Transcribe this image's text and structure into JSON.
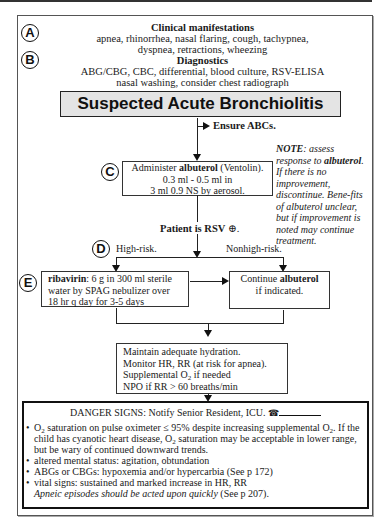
{
  "header": {
    "clinical_manifestations": {
      "label": "A",
      "title": "Clinical manifestations",
      "line1": "apnea, rhinorrhea, nasal flaring, cough, tachypnea,",
      "line2": "dyspnea, retractions, wheezing"
    },
    "diagnostics": {
      "label": "B",
      "title": "Diagnostics",
      "line1": "ABG/CBG, CBC, differential, blood culture, RSV-ELISA",
      "line2": "nasal washing, consider chest radiograph"
    }
  },
  "title": "Suspected Acute Bronchiolitis",
  "ensure_abcs": "Ensure ABCs.",
  "step_c": {
    "label": "C",
    "line1_pre": "Administer ",
    "line1_bold": "albuterol",
    "line1_post": " (Ventolin).",
    "line2": "0.3 ml - 0.5 ml in",
    "line3": "3 ml  0.9 NS by aerosol."
  },
  "note": {
    "bold1": "NOTE",
    "text1": ": assess response to ",
    "bold2": "albuterol",
    "text2": ". If there is no improvement, discontinue. Bene-fits of albuterol unclear, but if improvement is noted may continue treatment."
  },
  "rsv": {
    "text": "Patient is RSV",
    "symbol": "⊕",
    "end": "."
  },
  "step_d": {
    "label": "D",
    "high_risk": "High-risk.",
    "nonhigh_risk": "Nonhigh-risk."
  },
  "step_e": {
    "label": "E",
    "bold": "ribavirin",
    "line1": ": 6 g in 300 ml sterile",
    "line2": "water by SPAG nebulizer over",
    "line3": "18 hr q day for 3-5 days"
  },
  "continue_box": {
    "pre": "Continue ",
    "bold": "albuterol",
    "line2": "if indicated."
  },
  "supportive": {
    "line1": "Maintain adequate hydration.",
    "line2": "Monitor HR, RR (at risk for apnea).",
    "line3_pre": "Supplemental O",
    "line3_sub": "2",
    "line3_post": " if needed",
    "line4": "NPO if RR > 60 breaths/min"
  },
  "danger": {
    "title": "DANGER SIGNS: Notify Senior Resident, ICU.",
    "phone_icon": "☎",
    "bullet1_a": "O",
    "bullet1_sub": "2",
    "bullet1_b": " saturation on pulse oximeter  ≤ 95% despite increasing supplemental O",
    "bullet1_sub2": "2",
    "bullet1_c": ".",
    "bullet1_d": "If the child has cyanotic heart disease, O",
    "bullet1_sub3": "2",
    "bullet1_e": " saturation may be acceptable in lower range, but be wary of continued downward trends.",
    "bullet2": "altered mental status: agitation, obtundation",
    "bullet3": "ABGs or CBGs: hypoxemia and/or hypercarbia (See p 172)",
    "bullet4": "vital signs: sustained and marked increase in HR, RR",
    "apneic_italic": "Apneic episodes should be acted upon quickly",
    "apneic_ref": " (See p 207)."
  }
}
